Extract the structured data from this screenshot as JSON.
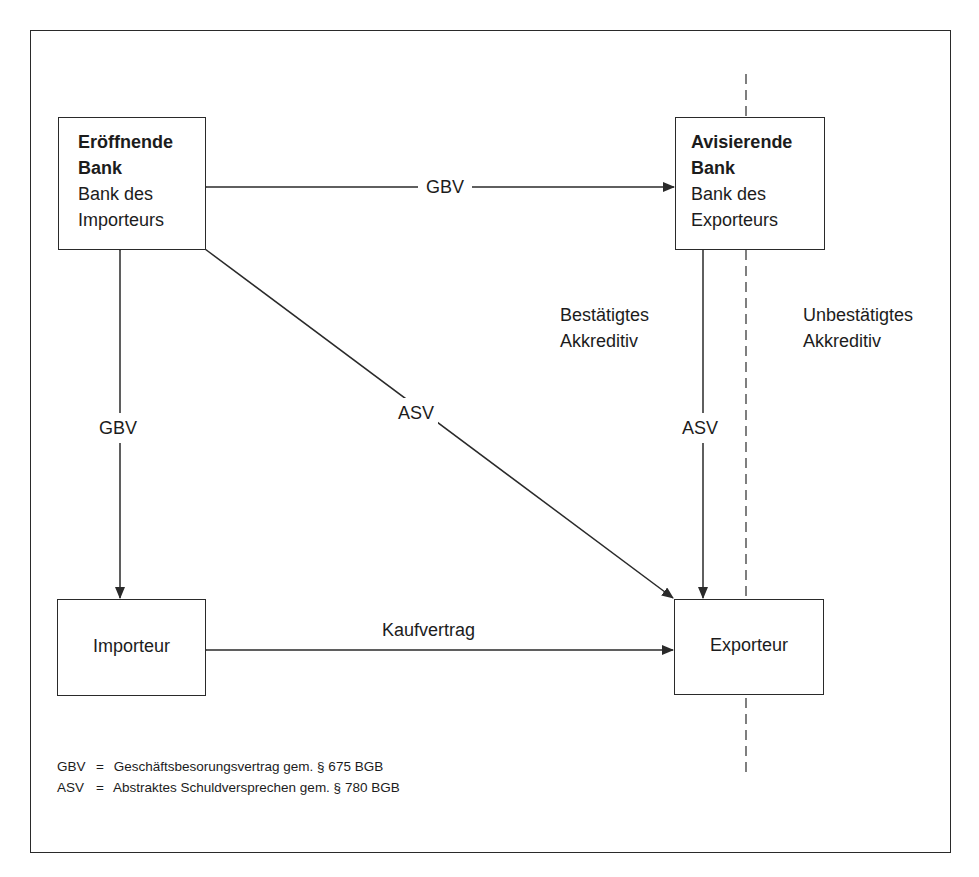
{
  "nodes": {
    "opening_bank": {
      "title": "Eröffnende",
      "title2": "Bank",
      "line1": "Bank des",
      "line2": "Importeurs"
    },
    "advising_bank": {
      "title": "Avisierende",
      "title2": "Bank",
      "line1": "Bank des",
      "line2": "Exporteurs"
    },
    "importer": {
      "label": "Importeur"
    },
    "exporter": {
      "label": "Exporteur"
    }
  },
  "edges": {
    "banks_top": {
      "label": "GBV",
      "direction": "bidirectional"
    },
    "opening_bank_importer": {
      "label": "GBV",
      "direction": "bidirectional"
    },
    "opening_bank_exporter_diagonal": {
      "label": "ASV",
      "direction": "to-exporter"
    },
    "advising_bank_exporter": {
      "label": "ASV",
      "direction": "to-exporter"
    },
    "importer_exporter": {
      "label": "Kaufvertrag",
      "direction": "bidirectional"
    }
  },
  "regions": {
    "confirmed": {
      "line1": "Bestätigtes",
      "line2": "Akkreditiv"
    },
    "unconfirmed": {
      "line1": "Unbestätigtes",
      "line2": "Akkreditiv"
    }
  },
  "legend": [
    {
      "abbr": "GBV",
      "eq": "=",
      "text": "Geschäftsbesorungsvertrag gem. § 675 BGB"
    },
    {
      "abbr": "ASV",
      "eq": "=",
      "text": "Abstraktes Schuldversprechen gem. § 780 BGB"
    }
  ],
  "colors": {
    "stroke": "#2a2a2a",
    "text": "#1c1c1c",
    "background": "#ffffff"
  }
}
